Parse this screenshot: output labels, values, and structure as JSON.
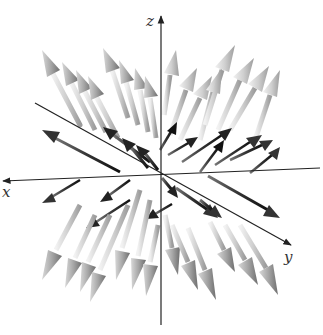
{
  "figure": {
    "type": "3d-vector-field",
    "axes": {
      "x_label": "x",
      "y_label": "y",
      "z_label": "z"
    },
    "colors": {
      "background": "#ffffff",
      "axis": "#222222",
      "arrow_near_light": "#d4d4d4",
      "arrow_mid": "#9a9a9a",
      "arrow_dark": "#2a2a2a"
    }
  }
}
